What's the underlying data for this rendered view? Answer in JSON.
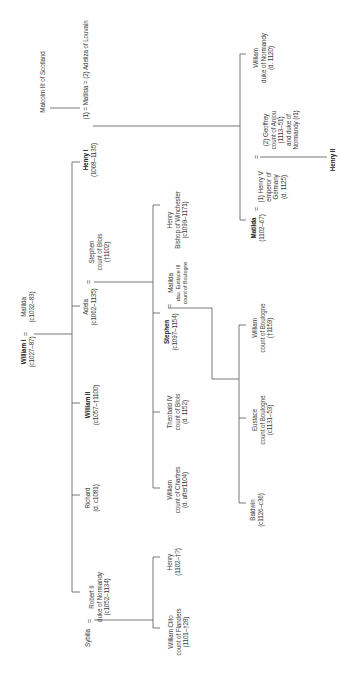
{
  "diagram": {
    "type": "family-tree",
    "orientation": "rotated-90-ccw",
    "line_color": "#555555",
    "marriage_symbol": "="
  },
  "people": {
    "william_i": {
      "name": "William I",
      "lines": [
        "(c1027–87)"
      ],
      "bold": true
    },
    "matilda_flanders": {
      "name": "Matilda",
      "lines": [
        "(c1032–83)"
      ]
    },
    "henry_i": {
      "name": "Henry I",
      "lines": [
        "(1068–1135)"
      ],
      "bold": true
    },
    "matilda_scotland": {
      "name": "(1) = Matilda = (2) Adeliza of Louvain"
    },
    "malcolm": {
      "name": "Malcolm III of Scotland"
    },
    "adela": {
      "name": "Adela",
      "lines": [
        "(c1062–1135)"
      ]
    },
    "stephen_blois": {
      "name": "Stephen",
      "lines": [
        "count of Blois",
        "(†1102)"
      ]
    },
    "william_ii": {
      "name": "William II",
      "lines": [
        "(c1057–†1100)"
      ],
      "bold": true
    },
    "richard": {
      "name": "Richard",
      "lines": [
        "(d. c1081)"
      ]
    },
    "robert_ii": {
      "name": "Robert II",
      "lines": [
        "duke of Normandy",
        "(c1052–1134)"
      ]
    },
    "sybilla": {
      "name": "Sybilla"
    },
    "henry_winchester": {
      "name": "Henry",
      "lines": [
        "Bishop of Winchester",
        "(c1099–1171)"
      ]
    },
    "matilda_boulogne": {
      "name": "Matilda",
      "lines": [
        "dau. Eustace III",
        "count of Boulogne"
      ]
    },
    "stephen": {
      "name": "Stephen",
      "lines": [
        "(c1097–1154)"
      ],
      "bold": true
    },
    "theobald_iv": {
      "name": "Theobald IV",
      "lines": [
        "count of Blois",
        "(d. 1152)"
      ]
    },
    "william_chartres": {
      "name": "William",
      "lines": [
        "count of Chartres",
        "(d. after1104)"
      ]
    },
    "henry_robert": {
      "name": "Henry",
      "lines": [
        "(1102–†?)"
      ]
    },
    "william_clito": {
      "name": "William Clito",
      "lines": [
        "count of Flanders",
        "(1101–†28)"
      ]
    },
    "william_normandy": {
      "name": "William",
      "lines": [
        "duke of Normandy",
        "(d. 1120)"
      ]
    },
    "empress_matilda": {
      "name": "Matilda",
      "lines": [
        "(1102–67)"
      ],
      "bold": true
    },
    "henry_v": {
      "name": "(1) Henry V",
      "lines": [
        "emperor of",
        "Germany",
        "(d. 1125)"
      ]
    },
    "geoffrey": {
      "name": "(2) Geoffrey",
      "lines": [
        "count of Anjou",
        "(1113–51)",
        "and duke of",
        "Normandy (ℓ1)"
      ]
    },
    "henry_ii": {
      "name": "Henry II",
      "bold": true
    },
    "william_boulogne": {
      "name": "William",
      "lines": [
        "count of Boulogne",
        "(†1159)"
      ]
    },
    "eustace": {
      "name": "Eustace",
      "lines": [
        "count of Boulogne",
        "(c1131–53)"
      ]
    },
    "baldwin": {
      "name": "Baldwin",
      "lines": [
        "(c1126–c36)"
      ]
    }
  }
}
